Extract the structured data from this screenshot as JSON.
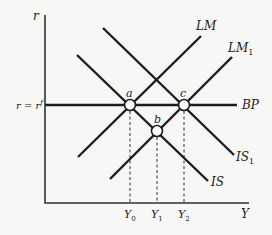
{
  "diagram": {
    "type": "IS-LM-BP",
    "axes": {
      "y_label": "r",
      "x_label": "Y"
    },
    "curves": [
      {
        "id": "LM",
        "label": "LM"
      },
      {
        "id": "LM1",
        "label": "LM",
        "subscript": "1"
      },
      {
        "id": "BP",
        "label": "BP",
        "left_label": "r = r",
        "left_label_sup": "f"
      },
      {
        "id": "IS",
        "label": "IS"
      },
      {
        "id": "IS1",
        "label": "IS",
        "subscript": "1"
      }
    ],
    "points": [
      {
        "id": "a",
        "label": "a"
      },
      {
        "id": "b",
        "label": "b"
      },
      {
        "id": "c",
        "label": "c"
      }
    ],
    "x_ticks": [
      {
        "label": "Y",
        "subscript": "0"
      },
      {
        "label": "Y",
        "subscript": "1"
      },
      {
        "label": "Y",
        "subscript": "2"
      }
    ]
  }
}
